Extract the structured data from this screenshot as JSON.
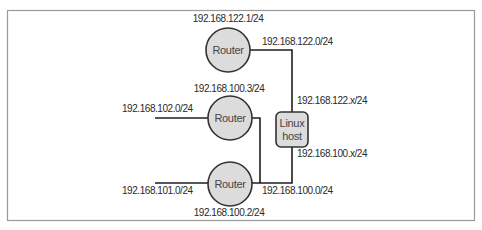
{
  "diagram": {
    "type": "network-topology",
    "colors": {
      "frame": "#9a9a9a",
      "line": "#1e1e1e",
      "node_fill": "#dcdcdc",
      "node_stroke": "#333333",
      "node_text": "#444444",
      "label_text": "#2a2a2a"
    },
    "nodes": {
      "router_top": {
        "label": "Router",
        "address": "192.168.122.1/24"
      },
      "router_middle": {
        "label": "Router",
        "address": "192.168.100.3/24"
      },
      "router_bottom": {
        "label": "Router",
        "address": "192.168.100.2/24"
      },
      "linux_host": {
        "label_line1": "Linux",
        "label_line2": "host"
      }
    },
    "networks": {
      "net_122": "192.168.122.0/24",
      "net_102": "192.168.102.0/24",
      "net_101": "192.168.101.0/24",
      "net_100": "192.168.100.0/24"
    },
    "host_interfaces": {
      "if_122": "192.168.122.x/24",
      "if_100": "192.168.100.x/24"
    },
    "edges": [
      {
        "from": "router_top",
        "to": "linux_host",
        "network": "192.168.122.0/24"
      },
      {
        "from": "router_middle",
        "to": "net_100",
        "network": "192.168.100.0/24"
      },
      {
        "from": "router_bottom",
        "to": "linux_host",
        "network": "192.168.100.0/24"
      },
      {
        "from": "external_102",
        "to": "router_middle",
        "network": "192.168.102.0/24"
      },
      {
        "from": "external_101",
        "to": "router_bottom",
        "network": "192.168.101.0/24"
      }
    ]
  }
}
